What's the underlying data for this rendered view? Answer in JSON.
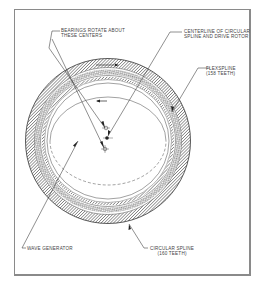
{
  "diagram": {
    "labels": {
      "bearings": [
        "BEARINGS ROTATE ABOUT",
        "THESE CENTERS"
      ],
      "centerline": [
        "CENTERLINE OF CIRCULAR",
        "SPLINE AND DRIVE ROTOR"
      ],
      "flexspline": [
        "FLEXSPLINE",
        "(158 TEETH)"
      ],
      "wave_generator": [
        "WAVE GENERATOR"
      ],
      "circular_spline": [
        "CIRCULAR SPLINE",
        "(160 TEETH)"
      ]
    },
    "components": [
      {
        "name": "circular spline",
        "teeth": 160
      },
      {
        "name": "flexspline",
        "teeth": 158
      },
      {
        "name": "wave generator"
      }
    ],
    "colors": {
      "line": "#333333",
      "hatch": "#555555",
      "frame": "#8a8a8a",
      "label": "#444444"
    }
  }
}
